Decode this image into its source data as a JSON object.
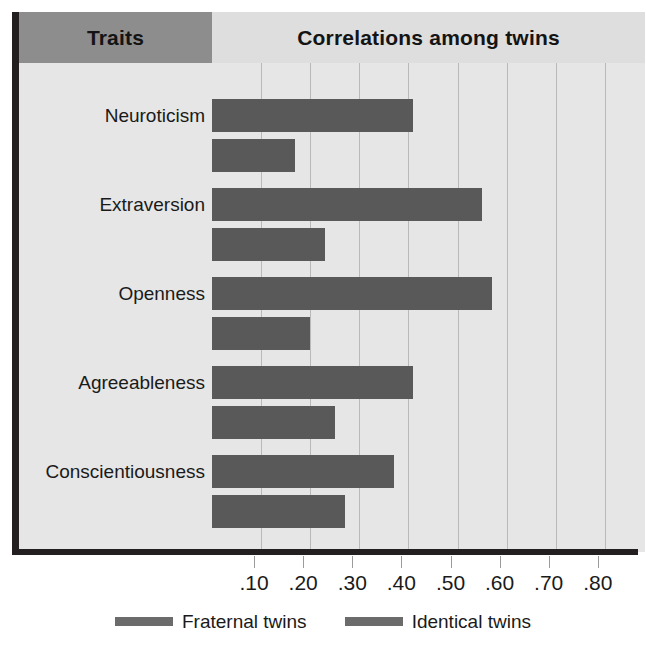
{
  "header": {
    "traits_label": "Traits",
    "correlations_label": "Correlations among twins"
  },
  "axis": {
    "tick_labels": [
      ".10",
      ".20",
      ".30",
      ".40",
      ".50",
      ".60",
      ".70",
      ".80"
    ]
  },
  "legend": {
    "entries": [
      {
        "label": "Fraternal twins",
        "color": "#6b6b6b"
      },
      {
        "label": "Identical twins",
        "color": "#6b6b6b"
      }
    ]
  },
  "colors": {
    "bar": "#595959",
    "plot_background": "#e6e6e6",
    "traits_header_background": "#8d8d8d",
    "correlations_header_background": "#dedede",
    "frame_line": "#231f20",
    "gridline": "#b9b9b9"
  },
  "chart_data": {
    "type": "bar",
    "title": "Correlations among twins",
    "xlabel": "",
    "ylabel": "Traits",
    "orientation": "horizontal",
    "categories": [
      "Neuroticism",
      "Extraversion",
      "Openness",
      "Agreeableness",
      "Conscientiousness"
    ],
    "series": [
      {
        "name": "Identical twins",
        "values": [
          0.41,
          0.55,
          0.57,
          0.41,
          0.37
        ]
      },
      {
        "name": "Fraternal twins",
        "values": [
          0.17,
          0.23,
          0.2,
          0.25,
          0.27
        ]
      }
    ],
    "xlim": [
      0,
      0.88
    ],
    "xticks": [
      0.1,
      0.2,
      0.3,
      0.4,
      0.5,
      0.6,
      0.7,
      0.8
    ],
    "grid": true,
    "legend_position": "bottom"
  }
}
